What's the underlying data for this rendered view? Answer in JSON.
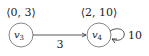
{
  "diagram": {
    "nodes": [
      {
        "id": "v3",
        "name": "v",
        "subscript": "3",
        "annotation": "⟨0, 3⟩"
      },
      {
        "id": "v4",
        "name": "v",
        "subscript": "4",
        "annotation": "⟨2, 10⟩"
      }
    ],
    "edges": [
      {
        "from": "v3",
        "to": "v4",
        "label": "3"
      },
      {
        "from": "v4",
        "to": "v4",
        "label": "10",
        "self_loop": true
      }
    ]
  }
}
